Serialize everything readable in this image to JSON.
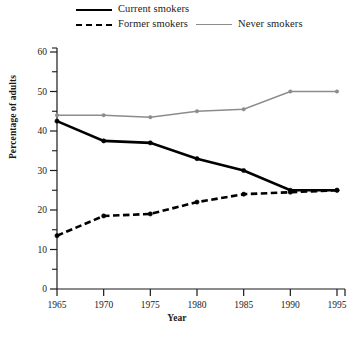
{
  "chart_data": {
    "type": "line",
    "title": "",
    "xlabel": "Year",
    "ylabel": "Percentage of adults",
    "x": [
      1965,
      1970,
      1975,
      1980,
      1985,
      1990,
      1995
    ],
    "xtick_labels": [
      "1965",
      "1970",
      "1975",
      "1980",
      "1985",
      "1990",
      "1995"
    ],
    "ytick_labels": [
      "0",
      "10",
      "20",
      "30",
      "40",
      "50",
      "60"
    ],
    "ytick_values": [
      0,
      10,
      20,
      30,
      40,
      50,
      60
    ],
    "yminor_values": [
      5,
      15,
      25,
      35,
      45,
      55
    ],
    "xlim": [
      1965,
      1995
    ],
    "ylim": [
      0,
      60
    ],
    "grid": false,
    "legend_position": "above-plot",
    "series": [
      {
        "name": "Current smokers",
        "style": "solid",
        "color": "#000000",
        "values": [
          42.5,
          37.5,
          37,
          33,
          30,
          25,
          25
        ]
      },
      {
        "name": "Former smokers",
        "style": "dashed",
        "color": "#000000",
        "values": [
          13.5,
          18.5,
          19,
          22,
          24,
          24.5,
          25
        ]
      },
      {
        "name": "Never smokers",
        "style": "solid",
        "color": "#8c8c8c",
        "values": [
          44,
          44,
          43.5,
          45,
          45.5,
          50,
          50
        ]
      }
    ]
  },
  "legend": {
    "current": "Current smokers",
    "former": "Former smokers",
    "never": "Never smokers"
  },
  "axes": {
    "x_title": "Year",
    "y_title": "Percentage of adults"
  },
  "ticks": {
    "x": [
      "1965",
      "1970",
      "1975",
      "1980",
      "1985",
      "1990",
      "1995"
    ],
    "y": [
      "60",
      "50",
      "40",
      "30",
      "20",
      "10",
      "0"
    ]
  },
  "colors": {
    "current": "#000000",
    "former": "#000000",
    "never": "#8c8c8c",
    "axis": "#1a1a1a",
    "background": "#ffffff"
  }
}
